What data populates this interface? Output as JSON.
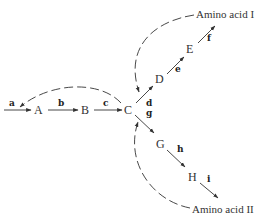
{
  "diagram": {
    "type": "branched metabolic pathway with feedback inhibition",
    "nodes": {
      "A": "A",
      "B": "B",
      "C": "C",
      "D": "D",
      "E": "E",
      "G": "G",
      "H": "H",
      "product1": "Amino acid I",
      "product2": "Amino acid II"
    },
    "enzymes": {
      "a": "a",
      "b": "b",
      "c": "c",
      "d": "d",
      "e": "e",
      "f": "f",
      "g": "g",
      "h": "h",
      "i": "i"
    },
    "edges": [
      {
        "from": "start",
        "to": "A",
        "label": "a",
        "style": "solid"
      },
      {
        "from": "A",
        "to": "B",
        "label": "b",
        "style": "solid"
      },
      {
        "from": "B",
        "to": "C",
        "label": "c",
        "style": "solid"
      },
      {
        "from": "C",
        "to": "D",
        "label": "d",
        "style": "solid"
      },
      {
        "from": "D",
        "to": "E",
        "label": "e",
        "style": "solid"
      },
      {
        "from": "E",
        "to": "Amino acid I",
        "label": "f",
        "style": "solid"
      },
      {
        "from": "C",
        "to": "G",
        "label": "g",
        "style": "solid"
      },
      {
        "from": "G",
        "to": "H",
        "label": "h",
        "style": "solid"
      },
      {
        "from": "H",
        "to": "Amino acid II",
        "label": "i",
        "style": "solid"
      },
      {
        "from": "C",
        "to": "step a",
        "style": "dashed",
        "meaning": "feedback"
      },
      {
        "from": "Amino acid I",
        "to": "step d",
        "style": "dashed",
        "meaning": "feedback"
      },
      {
        "from": "Amino acid II",
        "to": "step g",
        "style": "dashed",
        "meaning": "feedback"
      }
    ]
  }
}
